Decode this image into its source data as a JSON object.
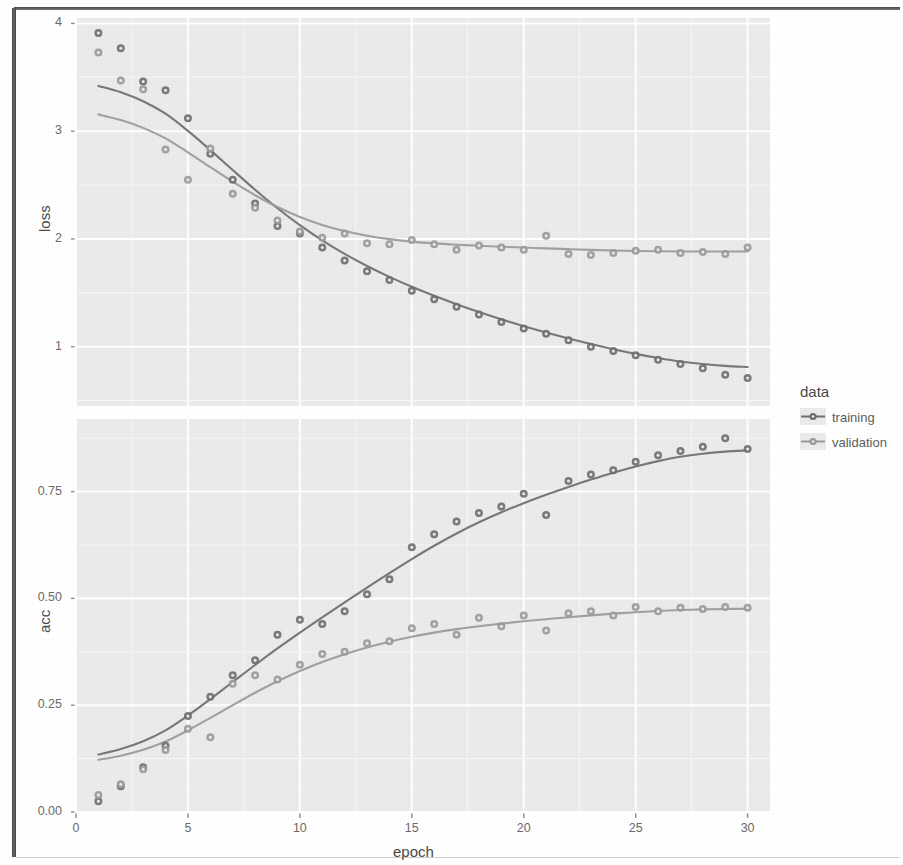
{
  "figure": {
    "kind": "faceted-scatter-with-smooth",
    "legend_title": "data",
    "x_axis_title": "epoch",
    "panels": [
      "loss",
      "acc"
    ],
    "series_names": [
      "training",
      "validation"
    ],
    "colors": {
      "training": "#6e6e6e",
      "validation": "#9a9a9a",
      "panel_bg": "#ebebeb",
      "grid": "#ffffff",
      "text": "#6b6b6b"
    }
  },
  "legend": {
    "title": "data",
    "items": [
      {
        "label": "training",
        "color": "#6e6e6e",
        "key": "point-line-key"
      },
      {
        "label": "validation",
        "color": "#9a9a9a",
        "key": "point-line-key"
      }
    ]
  },
  "chart_data": [
    {
      "type": "scatter",
      "title": "",
      "panel": "loss",
      "xlabel": "epoch",
      "ylabel": "loss",
      "xlim": [
        0.0,
        31.0
      ],
      "ylim": [
        0.45,
        4.05
      ],
      "xticks": [
        0,
        5,
        10,
        15,
        20,
        25,
        30
      ],
      "xticklabels": [
        "0",
        "5",
        "10",
        "15",
        "20",
        "25",
        "30"
      ],
      "yticks": [
        1,
        2,
        3,
        4
      ],
      "yticklabels": [
        "1",
        "2",
        "3",
        "4"
      ],
      "grid": true,
      "legend_position": "right",
      "x": [
        1,
        2,
        3,
        4,
        5,
        6,
        7,
        8,
        9,
        10,
        11,
        12,
        13,
        14,
        15,
        16,
        17,
        18,
        19,
        20,
        21,
        22,
        23,
        24,
        25,
        26,
        27,
        28,
        29,
        30
      ],
      "series": [
        {
          "name": "training",
          "color": "#6e6e6e",
          "smooth": true,
          "values": [
            3.91,
            3.77,
            3.46,
            3.38,
            3.12,
            2.79,
            2.55,
            2.33,
            2.12,
            2.05,
            1.92,
            1.8,
            1.7,
            1.62,
            1.52,
            1.44,
            1.37,
            1.3,
            1.23,
            1.17,
            1.12,
            1.06,
            1.0,
            0.96,
            0.92,
            0.88,
            0.84,
            0.8,
            0.74,
            0.71
          ]
        },
        {
          "name": "validation",
          "color": "#9a9a9a",
          "smooth": true,
          "values": [
            3.73,
            3.47,
            3.39,
            2.83,
            2.55,
            2.84,
            2.42,
            2.29,
            2.17,
            2.07,
            2.01,
            2.05,
            1.96,
            1.95,
            1.99,
            1.95,
            1.9,
            1.94,
            1.92,
            1.9,
            2.03,
            1.86,
            1.85,
            1.87,
            1.89,
            1.9,
            1.87,
            1.88,
            1.86,
            1.92
          ]
        }
      ]
    },
    {
      "type": "scatter",
      "title": "",
      "panel": "acc",
      "xlabel": "epoch",
      "ylabel": "acc",
      "xlim": [
        0.0,
        31.0
      ],
      "ylim": [
        0.0,
        0.92
      ],
      "xticks": [
        0,
        5,
        10,
        15,
        20,
        25,
        30
      ],
      "xticklabels": [
        "0",
        "5",
        "10",
        "15",
        "20",
        "25",
        "30"
      ],
      "yticks": [
        0.0,
        0.25,
        0.5,
        0.75
      ],
      "yticklabels": [
        "0.00",
        "0.25",
        "0.50",
        "0.75"
      ],
      "grid": true,
      "legend_position": "right",
      "x": [
        1,
        2,
        3,
        4,
        5,
        6,
        7,
        8,
        9,
        10,
        11,
        12,
        13,
        14,
        15,
        16,
        17,
        18,
        19,
        20,
        21,
        22,
        23,
        24,
        25,
        26,
        27,
        28,
        29,
        30
      ],
      "series": [
        {
          "name": "training",
          "color": "#6e6e6e",
          "smooth": true,
          "values": [
            0.025,
            0.06,
            0.105,
            0.155,
            0.225,
            0.27,
            0.32,
            0.355,
            0.415,
            0.45,
            0.44,
            0.47,
            0.51,
            0.545,
            0.62,
            0.65,
            0.68,
            0.7,
            0.715,
            0.745,
            0.695,
            0.775,
            0.79,
            0.8,
            0.82,
            0.835,
            0.845,
            0.855,
            0.875,
            0.85
          ]
        },
        {
          "name": "validation",
          "color": "#9a9a9a",
          "smooth": true,
          "values": [
            0.04,
            0.065,
            0.1,
            0.145,
            0.195,
            0.175,
            0.3,
            0.32,
            0.31,
            0.345,
            0.37,
            0.375,
            0.395,
            0.4,
            0.43,
            0.44,
            0.415,
            0.455,
            0.435,
            0.46,
            0.425,
            0.465,
            0.47,
            0.46,
            0.48,
            0.47,
            0.478,
            0.475,
            0.48,
            0.478
          ]
        }
      ]
    }
  ]
}
